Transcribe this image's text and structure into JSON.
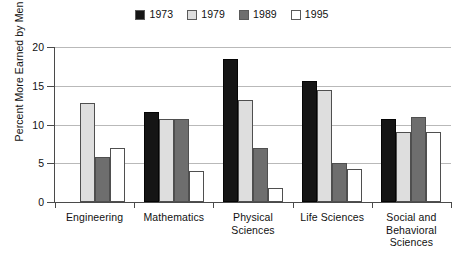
{
  "chart_data": {
    "type": "bar",
    "title": "",
    "xlabel": "",
    "ylabel": "Percent More Earned by Men",
    "ylim": [
      0,
      20
    ],
    "yticks": [
      0,
      5,
      10,
      15,
      20
    ],
    "ytick_labels": [
      "0",
      "5",
      "10",
      "15",
      "20"
    ],
    "grid": "horizontal",
    "legend_position": "top-center",
    "categories": [
      "Engineering",
      "Mathematics",
      "Physical Sciences",
      "Life Sciences",
      "Social and Behavioral Sciences"
    ],
    "category_lines": [
      [
        "Engineering"
      ],
      [
        "Mathematics"
      ],
      [
        "Physical",
        "Sciences"
      ],
      [
        "Life Sciences"
      ],
      [
        "Social and",
        "Behavioral",
        "Sciences"
      ]
    ],
    "series": [
      {
        "name": "1973",
        "color": "#151515",
        "values": [
          null,
          11.6,
          18.4,
          15.6,
          10.7
        ]
      },
      {
        "name": "1979",
        "color": "#dedede",
        "values": [
          12.8,
          10.7,
          13.2,
          14.4,
          9.0
        ]
      },
      {
        "name": "1989",
        "color": "#6e6e6e",
        "values": [
          5.8,
          10.7,
          7.0,
          5.0,
          11.0
        ]
      },
      {
        "name": "1995",
        "color": "#ffffff",
        "values": [
          7.0,
          4.0,
          1.8,
          4.2,
          9.0
        ]
      }
    ]
  },
  "legend": {
    "entries": [
      {
        "label": "1973",
        "swatch": "black-square-swatch"
      },
      {
        "label": "1979",
        "swatch": "light-gray-square-swatch"
      },
      {
        "label": "1989",
        "swatch": "medium-gray-square-swatch"
      },
      {
        "label": "1995",
        "swatch": "white-square-swatch"
      }
    ]
  }
}
